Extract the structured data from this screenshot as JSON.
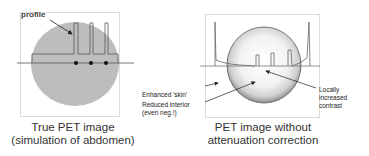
{
  "left_panel": {
    "annotation": "profile",
    "caption_line1": "True PET image",
    "caption_line2": "(simulation of abdomen)",
    "colors": {
      "ellipse": "#bdbdbd",
      "profile": "#555555"
    }
  },
  "right_panel": {
    "annotations": {
      "enhanced_skin": "Enhanced 'skin'",
      "reduced_interior_line1": "Reduced interior",
      "reduced_interior_line2": "(even neg.!)",
      "local_contrast_line1": "Locally",
      "local_contrast_line2": "increased",
      "local_contrast_line3": "contrast"
    },
    "caption_line1": "PET image without",
    "caption_line2": "attenuation correction"
  }
}
